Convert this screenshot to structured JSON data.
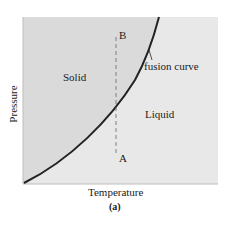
{
  "diagram": {
    "type": "phase-diagram",
    "regions": [
      {
        "name": "solid",
        "label": "Solid",
        "color": "#d9d9d9"
      },
      {
        "name": "liquid",
        "label": "Liquid",
        "color": "#e6e6e6"
      }
    ],
    "curve_label": "fusion curve",
    "points": {
      "a": "A",
      "b": "B"
    },
    "axes": {
      "x_label": "Temperature",
      "y_label": "Pressure"
    },
    "caption": "(a)",
    "curve_color": "#222222"
  }
}
